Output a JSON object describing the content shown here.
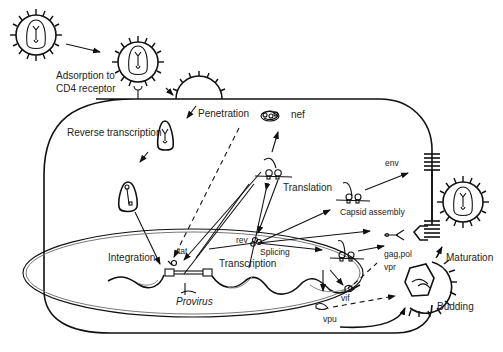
{
  "diagram": {
    "type": "HIV replication cycle in a host cell",
    "labels": {
      "adsorption_line1": "Adsorption to",
      "adsorption_line2": "CD4 receptor",
      "penetration": "Penetration",
      "reverse_transcription": "Reverse transcription",
      "nef": "nef",
      "translation": "Translation",
      "env": "env",
      "capsid_assembly": "Capsid assembly",
      "rev": "rev",
      "splicing": "Splicing",
      "tat": "tat",
      "integration": "Integration",
      "transcription": "Transcription",
      "provirus": "Provirus",
      "gag_pol": "gag,pol",
      "vpr": "vpr",
      "vif": "vif",
      "vpu": "vpu",
      "maturation": "Maturation",
      "budding": "Budding"
    },
    "stages": [
      "Adsorption to CD4 receptor",
      "Penetration",
      "Reverse transcription",
      "Integration",
      "Transcription",
      "Splicing",
      "Translation",
      "Capsid assembly",
      "Budding",
      "Maturation"
    ],
    "viral_proteins": [
      "nef",
      "tat",
      "rev",
      "env",
      "gag,pol",
      "vpr",
      "vif",
      "vpu"
    ],
    "colors": {
      "line": "#111111",
      "background": "#ffffff",
      "text": "#222222"
    }
  }
}
